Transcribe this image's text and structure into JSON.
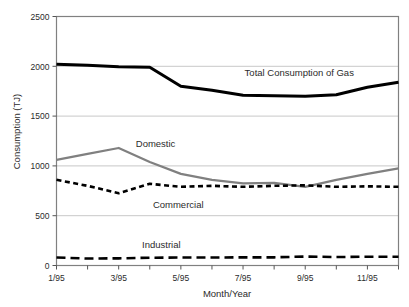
{
  "chart_data": {
    "type": "line",
    "title": "",
    "xlabel": "Month/Year",
    "ylabel": "Consumption (TJ)",
    "x": [
      1,
      2,
      3,
      4,
      5,
      6,
      7,
      8,
      9,
      10,
      11,
      12
    ],
    "categories": [
      "1/95",
      "2/95",
      "3/95",
      "4/95",
      "5/95",
      "6/95",
      "7/95",
      "8/95",
      "9/95",
      "10/95",
      "11/95",
      "12/95"
    ],
    "xtick_labels": [
      "1/95",
      "3/95",
      "5/95",
      "7/95",
      "9/95",
      "11/95"
    ],
    "xtick_values": [
      1,
      3,
      5,
      7,
      9,
      11
    ],
    "ytick_labels": [
      "0",
      "500",
      "1000",
      "1500",
      "2000",
      "2500"
    ],
    "ytick_values": [
      0,
      500,
      1000,
      1500,
      2000,
      2500
    ],
    "xlim": [
      1,
      12
    ],
    "ylim": [
      0,
      2500
    ],
    "grid": "horizontal",
    "legend_position": "inline-annotations",
    "series": [
      {
        "name": "Total Consumption of Gas",
        "style": "solid",
        "color": "#000000",
        "width": 3.0,
        "values": [
          2020,
          2010,
          1995,
          1990,
          1800,
          1760,
          1710,
          1705,
          1700,
          1715,
          1790,
          1840
        ]
      },
      {
        "name": "Domestic",
        "style": "solid",
        "color": "#808080",
        "width": 2.2,
        "values": [
          1060,
          1120,
          1180,
          1040,
          920,
          860,
          825,
          830,
          790,
          860,
          920,
          975
        ]
      },
      {
        "name": "Commercial",
        "style": "dashed-short",
        "color": "#000000",
        "width": 2.6,
        "values": [
          860,
          800,
          725,
          820,
          790,
          800,
          790,
          800,
          805,
          790,
          795,
          790
        ]
      },
      {
        "name": "Industrial",
        "style": "dashed-long",
        "color": "#000000",
        "width": 2.6,
        "values": [
          80,
          70,
          72,
          78,
          80,
          80,
          82,
          82,
          90,
          85,
          88,
          88
        ]
      }
    ],
    "annotations": [
      {
        "text": "Total Consumption of Gas",
        "x": 7.05,
        "y": 1935
      },
      {
        "text": "Domestic",
        "x": 3.55,
        "y": 1215
      },
      {
        "text": "Commercial",
        "x": 4.1,
        "y": 610
      },
      {
        "text": "Industrial",
        "x": 3.75,
        "y": 205
      }
    ],
    "colors": {
      "total": "#000000",
      "domestic": "#808080",
      "commercial": "#000000",
      "industrial": "#000000",
      "grid": "#c8c8c8",
      "frame": "#808080",
      "background": "#ffffff"
    }
  }
}
